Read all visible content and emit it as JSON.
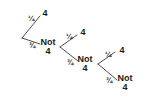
{
  "diagram": {
    "type": "probability-tree",
    "background_color": "#ffffff",
    "line_color": "#3a3a3a",
    "text_color": "#1a1a1a",
    "outcomes": {
      "success": "4",
      "failure_line1": "Not",
      "failure_line2": "4"
    },
    "probabilities": {
      "success": "¼",
      "failure": "¾"
    },
    "nodes": [
      {
        "id": "root",
        "x": 22,
        "y": 38,
        "kind": "vertex",
        "label": ""
      },
      {
        "id": "l1-up",
        "x": 45,
        "y": 14,
        "kind": "outcome",
        "label": "4"
      },
      {
        "id": "l1-down",
        "x": 48,
        "y": 47,
        "kind": "outcome",
        "label": "Not 4"
      },
      {
        "id": "l2-up",
        "x": 83,
        "y": 33,
        "kind": "outcome",
        "label": "4"
      },
      {
        "id": "l2-down",
        "x": 85,
        "y": 64,
        "kind": "outcome",
        "label": "Not 4"
      },
      {
        "id": "l3-up",
        "x": 122,
        "y": 51,
        "kind": "outcome",
        "label": "4"
      },
      {
        "id": "l3-down",
        "x": 125,
        "y": 83,
        "kind": "outcome",
        "label": "Not 4"
      }
    ],
    "branches": [
      {
        "id": "b1-up",
        "from": "root",
        "to": "l1-up",
        "prob": "¼",
        "label_x": 31,
        "label_y": 19
      },
      {
        "id": "b1-down",
        "from": "root",
        "to": "l1-down",
        "prob": "¾",
        "label_x": 32,
        "label_y": 46
      },
      {
        "id": "b2-up",
        "from": "l1-down",
        "to": "l2-up",
        "prob": "¼",
        "label_x": 69,
        "label_y": 37
      },
      {
        "id": "b2-down",
        "from": "l1-down",
        "to": "l2-down",
        "prob": "¾",
        "label_x": 70,
        "label_y": 63
      },
      {
        "id": "b3-up",
        "from": "l2-down",
        "to": "l3-up",
        "prob": "¼",
        "label_x": 108,
        "label_y": 55
      },
      {
        "id": "b3-down",
        "from": "l2-down",
        "to": "l3-down",
        "prob": "¾",
        "label_x": 109,
        "label_y": 81
      }
    ]
  }
}
